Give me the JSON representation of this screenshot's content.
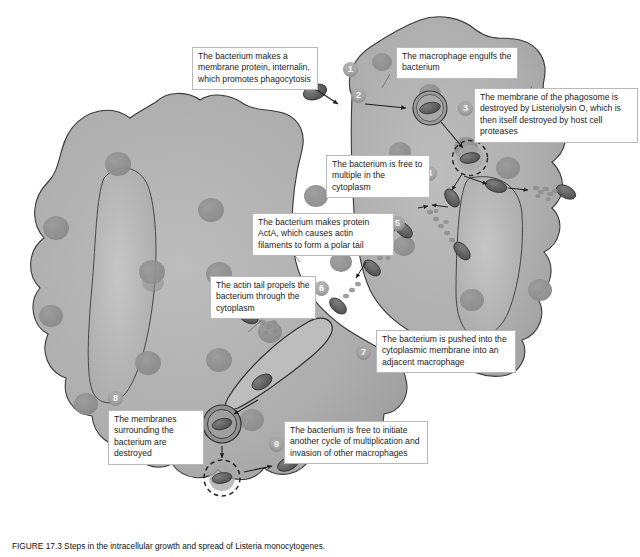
{
  "figure": {
    "title_id": "FIGURE 17.3",
    "caption": "FIGURE 17.3  Steps in the intracellular growth and spread of Listeria monocytogenes.",
    "colors": {
      "cytoplasm": "#a7a7a7",
      "cytoplasm_light": "#b5b5b5",
      "organelle": "#909090",
      "nucleus": "#b0b0b0",
      "outline": "#3a3a3a",
      "bacterium": "#6f6f6f",
      "bacterium_dark": "#4d4d4d",
      "actin_tail": "#8f8f8f",
      "callout_bg": "#ffffff",
      "callout_border": "#b9b9b9",
      "step_marker": "#a9a9a9",
      "arrow": "#1f1f1f",
      "page_bg": "#ffffff"
    }
  },
  "steps": [
    {
      "n": "1",
      "label": "1",
      "text": "The bacterium makes a membrane protein, internalin, which promotes phagocytosis"
    },
    {
      "n": "2",
      "label": "2",
      "text": "The macrophage engulfs the bacterium"
    },
    {
      "n": "3",
      "label": "3",
      "text": "The membrane of the phagosome is destroyed by Listeriolysin O, which is then itself destroyed by host cell proteases"
    },
    {
      "n": "4",
      "label": "4",
      "text": "The bacterium is free to multiple in the cytoplasm"
    },
    {
      "n": "5",
      "label": "5",
      "text": "The bacterium makes protein ActA, which causes actin filaments to form a polar tail"
    },
    {
      "n": "6",
      "label": "6",
      "text": "The actin tail propels the bacterium through the cytoplasm"
    },
    {
      "n": "7",
      "label": "7",
      "text": "The bacterium is pushed into the cytoplasmic membrane into an adjacent macrophage"
    },
    {
      "n": "8",
      "label": "8",
      "text": "The membranes surrounding the bacterium are destroyed"
    },
    {
      "n": "9",
      "label": "9",
      "text": "The bacterium is free to initiate another cycle of multiplication and invasion of other macrophages"
    }
  ],
  "structures": {
    "macrophage_1": "macrophage (left/lower cell)",
    "macrophage_2": "adjacent macrophage (upper right cell)",
    "nucleus_1": "nucleus of first macrophage",
    "nucleus_2": "nucleus of adjacent macrophage",
    "phagosome": "phagosome vacuole",
    "double_membrane_vacuole": "double-membrane vacuole",
    "bacterium": "Listeria bacterium",
    "actin_tail": "polar actin tail",
    "protrusion": "membrane protrusion into adjacent cell"
  }
}
